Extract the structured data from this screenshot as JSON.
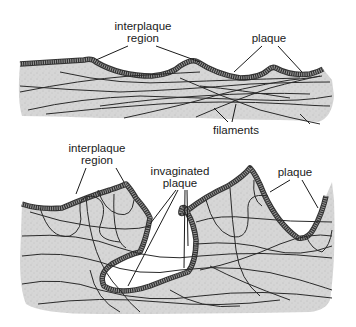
{
  "figure": {
    "panels": [
      {
        "id": "top",
        "description": "cell membrane surface with plaques and interplaque regions, filaments beneath",
        "labels": {
          "interplaque_region_line1": "interplaque",
          "interplaque_region_line2": "region",
          "plaque": "plaque",
          "filaments": "filaments"
        }
      },
      {
        "id": "bottom",
        "description": "membrane with invaginated plaque folding inward, filament network beneath",
        "labels": {
          "interplaque_region_line1": "interplaque",
          "interplaque_region_line2": "region",
          "invaginated_plaque_line1": "invaginated",
          "invaginated_plaque_line2": "plaque",
          "plaque": "plaque"
        }
      }
    ],
    "colors": {
      "cytoplasm_fill": "#d4d4d4",
      "membrane_plaque": "#7a7a7a",
      "membrane_edge": "#333333",
      "filament": "#2a2a2a",
      "leader_line": "#1a1a1a",
      "background": "#ffffff"
    }
  }
}
